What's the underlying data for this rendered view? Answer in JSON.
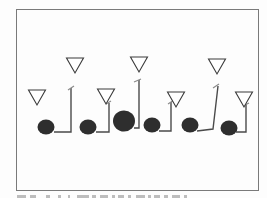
{
  "diagram": {
    "type": "football-play-diagram",
    "colors": {
      "frame": "#7a7a7a",
      "player_fill": "#2e2e2e",
      "route_stroke": "#4a4a4a",
      "defender_stroke": "#3a3a3a",
      "background": "#fdfdfd"
    },
    "offense": [
      {
        "id": "O1",
        "shape": "circle",
        "size": "normal"
      },
      {
        "id": "O2",
        "shape": "circle",
        "size": "normal"
      },
      {
        "id": "O3",
        "shape": "circle",
        "size": "large"
      },
      {
        "id": "O4",
        "shape": "circle",
        "size": "normal"
      },
      {
        "id": "O5",
        "shape": "circle",
        "size": "normal"
      },
      {
        "id": "O6",
        "shape": "circle",
        "size": "normal"
      }
    ],
    "defense": [
      {
        "id": "D1",
        "shape": "inverted-triangle"
      },
      {
        "id": "D2",
        "shape": "inverted-triangle"
      },
      {
        "id": "D3",
        "shape": "inverted-triangle"
      },
      {
        "id": "D4",
        "shape": "inverted-triangle"
      },
      {
        "id": "D5",
        "shape": "inverted-triangle"
      },
      {
        "id": "D6",
        "shape": "inverted-triangle"
      },
      {
        "id": "D7",
        "shape": "inverted-triangle"
      }
    ],
    "routes": [
      {
        "from": "O1",
        "toward": "D2",
        "kind": "out-and-up"
      },
      {
        "from": "O2",
        "toward": "D3",
        "kind": "out-and-up"
      },
      {
        "from": "O3",
        "toward": "D4",
        "kind": "out-and-up"
      },
      {
        "from": "O4",
        "toward": "D5",
        "kind": "out-and-up"
      },
      {
        "from": "O5",
        "toward": "D6",
        "kind": "out-and-up"
      },
      {
        "from": "O6",
        "toward": "D7",
        "kind": "out-and-up"
      }
    ],
    "caption": {
      "text": "",
      "note": "caption truncated at image edge; illegible"
    }
  }
}
